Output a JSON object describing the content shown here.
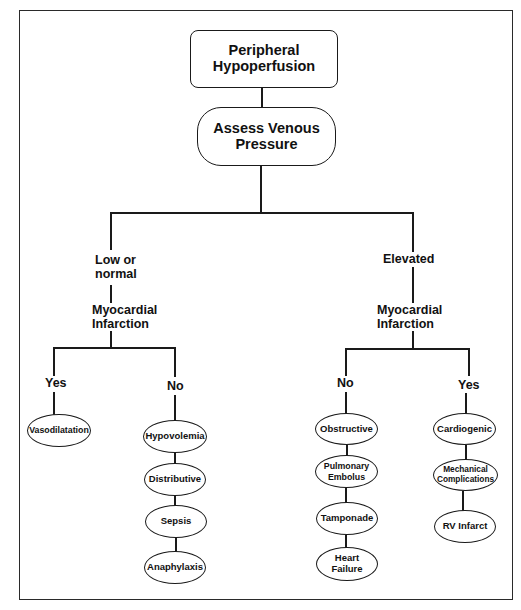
{
  "diagram": {
    "type": "flowchart",
    "root": {
      "label_line1": "Peripheral",
      "label_line2": "Hypoperfusion"
    },
    "assess": {
      "label_line1": "Assess Venous",
      "label_line2": "Pressure"
    },
    "left_branch": {
      "condition_line1": "Low or",
      "condition_line2": "normal",
      "question_line1": "Myocardial",
      "question_line2": "Infarction",
      "yes_label": "Yes",
      "no_label": "No",
      "yes_nodes": [
        {
          "label": "Vasodilatation"
        }
      ],
      "no_nodes": [
        {
          "label": "Hypovolemia"
        },
        {
          "label": "Distributive"
        },
        {
          "label": "Sepsis"
        },
        {
          "label": "Anaphylaxis"
        }
      ]
    },
    "right_branch": {
      "condition": "Elevated",
      "question_line1": "Myocardial",
      "question_line2": "Infarction",
      "no_label": "No",
      "yes_label": "Yes",
      "no_nodes": [
        {
          "label": "Obstructive"
        },
        {
          "label_line1": "Pulmonary",
          "label_line2": "Embolus"
        },
        {
          "label": "Tamponade"
        },
        {
          "label_line1": "Heart",
          "label_line2": "Failure"
        }
      ],
      "yes_nodes": [
        {
          "label": "Cardiogenic"
        },
        {
          "label_line1": "Mechanical",
          "label_line2": "Complications"
        },
        {
          "label": "RV Infarct"
        }
      ]
    }
  },
  "colors": {
    "line": "#1a1a1a",
    "background": "#ffffff",
    "text": "#111111"
  }
}
